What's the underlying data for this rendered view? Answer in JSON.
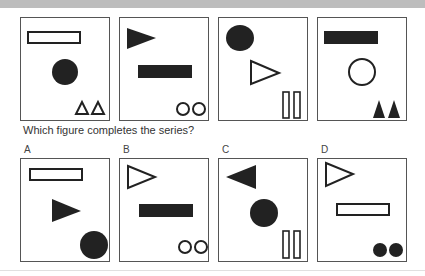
{
  "question": "Which figure completes the series?",
  "series": [
    {
      "id": "figure-1",
      "shapes": [
        "outline-rectangle",
        "filled-circle",
        "two-outline-triangles"
      ]
    },
    {
      "id": "figure-2",
      "shapes": [
        "filled-triangle-right",
        "filled-rectangle",
        "two-outline-circles"
      ]
    },
    {
      "id": "figure-3",
      "shapes": [
        "filled-circle",
        "outline-triangle-right",
        "two-outline-bars"
      ]
    },
    {
      "id": "figure-4",
      "shapes": [
        "filled-rectangle",
        "outline-circle",
        "two-filled-triangles"
      ]
    }
  ],
  "options": [
    {
      "label": "A",
      "shapes": [
        "outline-rectangle",
        "filled-triangle-right",
        "filled-circle"
      ]
    },
    {
      "label": "B",
      "shapes": [
        "outline-triangle-right",
        "filled-rectangle",
        "two-outline-circles"
      ]
    },
    {
      "label": "C",
      "shapes": [
        "filled-triangle-left",
        "filled-circle",
        "two-outline-bars"
      ]
    },
    {
      "label": "D",
      "shapes": [
        "outline-triangle-right",
        "outline-rectangle",
        "two-filled-circles"
      ]
    }
  ],
  "colors": {
    "fill": "#222222",
    "stroke": "#222222",
    "border": "#555555",
    "band": "#bdbdbd"
  }
}
